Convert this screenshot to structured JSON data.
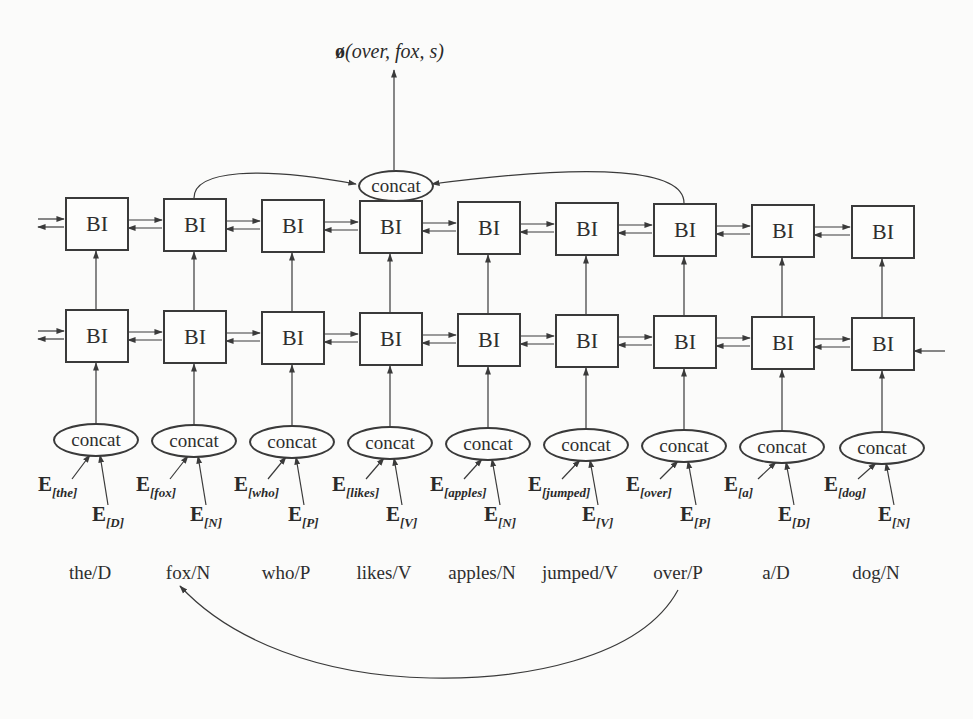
{
  "output_label": {
    "symbol": "ø",
    "args": "(over, fox, s)"
  },
  "top_concat": {
    "label": "concat"
  },
  "upper_layer": {
    "cell_label": "BI",
    "count": 9
  },
  "lower_layer": {
    "cell_label": "BI",
    "count": 9
  },
  "columns": [
    {
      "word": "the/D",
      "concat": "concat",
      "word_emb": "the",
      "tag_emb": "D"
    },
    {
      "word": "fox/N",
      "concat": "concat",
      "word_emb": "fox",
      "tag_emb": "N"
    },
    {
      "word": "who/P",
      "concat": "concat",
      "word_emb": "who",
      "tag_emb": "P"
    },
    {
      "word": "likes/V",
      "concat": "concat",
      "word_emb": "likes",
      "tag_emb": "V"
    },
    {
      "word": "apples/N",
      "concat": "concat",
      "word_emb": "apples",
      "tag_emb": "N"
    },
    {
      "word": "jumped/V",
      "concat": "concat",
      "word_emb": "jumped",
      "tag_emb": "V"
    },
    {
      "word": "over/P",
      "concat": "concat",
      "word_emb": "over",
      "tag_emb": "P"
    },
    {
      "word": "a/D",
      "concat": "concat",
      "word_emb": "a",
      "tag_emb": "D"
    },
    {
      "word": "dog/N",
      "concat": "concat",
      "word_emb": "dog",
      "tag_emb": "N"
    }
  ],
  "embedding_prefix": "E",
  "dependency_arc": {
    "from": "over/P",
    "to": "fox/N"
  },
  "top_concat_inputs": [
    "fox/N",
    "over/P"
  ],
  "colors": {
    "line": "#3a3a3a",
    "background": "#fbfbfa",
    "text": "#2a2a2a"
  }
}
